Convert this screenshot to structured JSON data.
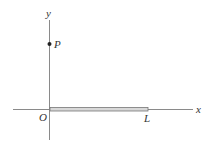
{
  "diagram": {
    "axes": {
      "x_label": "x",
      "y_label": "y",
      "origin_label": "O"
    },
    "point": {
      "label": "P",
      "location": "on positive y-axis"
    },
    "rod": {
      "end_label": "L",
      "from": "O",
      "to": "L",
      "along": "positive x-axis"
    },
    "colors": {
      "axis": "#888888",
      "rod_outline": "#777777",
      "rod_fill": "#d8d8d8",
      "point": "#222222",
      "label": "#333333"
    }
  }
}
